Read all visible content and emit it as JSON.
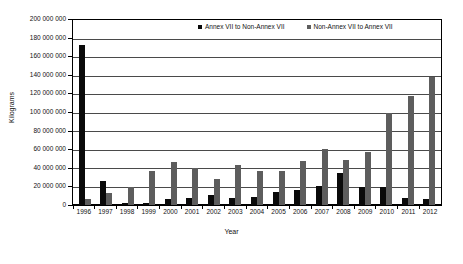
{
  "chart_data": {
    "type": "bar",
    "title": "",
    "xlabel": "Year",
    "ylabel": "Kilograms",
    "ylim": [
      0,
      200000000
    ],
    "ytick_step": 20000000,
    "grid": true,
    "legend_position": "top-center-inside",
    "categories": [
      "1996",
      "1997",
      "1998",
      "1999",
      "2000",
      "2001",
      "2002",
      "2003",
      "2004",
      "2005",
      "2006",
      "2007",
      "2008",
      "2009",
      "2010",
      "2011",
      "2012"
    ],
    "ytick_labels": [
      "200 000 000",
      "180 000 000",
      "160 000 000",
      "140 000 000",
      "120 000 000",
      "100 000 000",
      "80 000 000",
      "60 000 000",
      "40 000 000",
      "20 000 000",
      "0"
    ],
    "series": [
      {
        "name": "Annex VII to Non-Annex VII",
        "color": "#0a0a0a",
        "values": [
          173000000,
          26000000,
          2000000,
          2000000,
          6000000,
          8000000,
          11000000,
          8000000,
          9000000,
          14000000,
          16000000,
          21000000,
          35000000,
          20000000,
          20000000,
          8000000,
          6000000
        ]
      },
      {
        "name": "Non-Annex VII to Annex VII",
        "color": "#5d5d5d",
        "values": [
          6000000,
          13000000,
          19000000,
          37000000,
          46000000,
          40000000,
          28000000,
          43000000,
          37000000,
          37000000,
          48000000,
          61000000,
          49000000,
          57000000,
          99000000,
          118000000,
          138000000
        ]
      }
    ]
  },
  "axis": {
    "y_title": "Kilograms",
    "x_title": "Year"
  },
  "legend": {
    "items": [
      {
        "label": "Annex VII to Non-Annex VII",
        "color": "#0a0a0a"
      },
      {
        "label": "Non-Annex VII to Annex VII",
        "color": "#5d5d5d"
      }
    ]
  }
}
